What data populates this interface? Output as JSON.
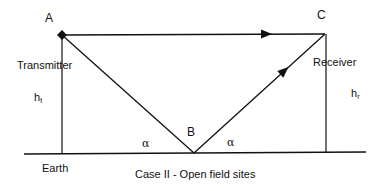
{
  "diagram": {
    "caption": "Case II - Open field sites",
    "points": {
      "A": {
        "label": "A",
        "role": "transmitter antenna"
      },
      "B": {
        "label": "B",
        "role": "ground reflection point"
      },
      "C": {
        "label": "C",
        "role": "receiver antenna"
      }
    },
    "labels": {
      "transmitter": "Transmitter",
      "receiver": "Receiver",
      "earth": "Earth",
      "ht_main": "h",
      "ht_sub": "t",
      "hr_main": "h",
      "hr_sub": "r",
      "alpha_left": "α",
      "alpha_right": "α"
    },
    "edges": [
      {
        "from": "A",
        "to": "C",
        "type": "direct ray",
        "arrow": true
      },
      {
        "from": "A",
        "to": "B",
        "type": "incident ray",
        "arrow": false
      },
      {
        "from": "B",
        "to": "C",
        "type": "reflected ray",
        "arrow": true
      },
      {
        "from": "A",
        "to": "ground",
        "type": "transmitter height h_t"
      },
      {
        "from": "C",
        "to": "ground",
        "type": "receiver height h_r"
      }
    ],
    "colors": {
      "line": "#111111",
      "background": "#ffffff"
    }
  }
}
